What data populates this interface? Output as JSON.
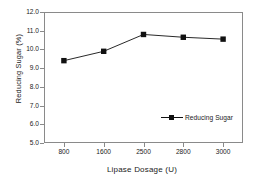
{
  "chart_data": {
    "type": "line",
    "title": "",
    "xlabel": "Lipase Dosage (U)",
    "ylabel": "Reducing Sugar (%)",
    "categories": [
      "800",
      "1600",
      "2500",
      "2800",
      "3000"
    ],
    "series": [
      {
        "name": "Reducing Sugar",
        "values": [
          9.4,
          9.9,
          10.8,
          10.65,
          10.55
        ],
        "color": "#111111",
        "marker": "square"
      }
    ],
    "ylim": [
      5.0,
      12.0
    ],
    "ytick_step": 1.0,
    "yticks": [
      "12.0",
      "11.0",
      "10.0",
      "9.0",
      "8.0",
      "7.0",
      "6.0",
      "5.0"
    ],
    "ytick_values": [
      12.0,
      11.0,
      10.0,
      9.0,
      8.0,
      7.0,
      6.0,
      5.0
    ],
    "grid": false,
    "legend_position": "inside-lower-right",
    "frame": true,
    "background_color": "#ffffff",
    "axis_color": "#8a8a8a",
    "text_color": "#1a1a1a"
  },
  "legend": {
    "entries": [
      {
        "label": "Reducing Sugar",
        "color": "#111111"
      }
    ]
  }
}
